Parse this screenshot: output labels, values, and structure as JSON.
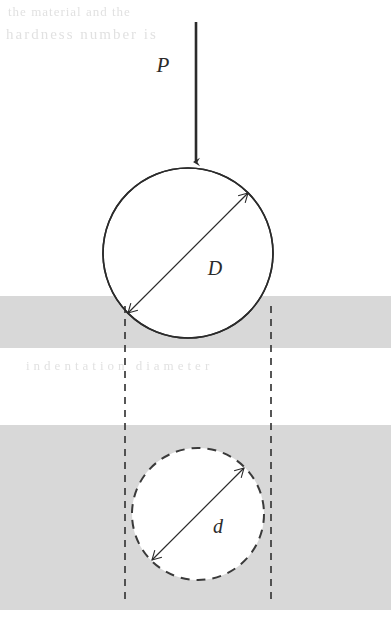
{
  "figure": {
    "background_color": "#ffffff",
    "specimen_color": "#d8d8d8",
    "line_color": "#2b2b2b",
    "width": 391,
    "height": 625
  },
  "labels": {
    "load": "P",
    "ball_diameter": "D",
    "indent_diameter": "d"
  },
  "annotations": {
    "load_arrow_name": "applied-load-arrow",
    "ball_arrow_name": "ball-diameter-arrow",
    "indent_arrow_name": "indent-diameter-arrow"
  },
  "geometry": {
    "upper_circle": {
      "cx": 188,
      "cy": 253,
      "r": 85,
      "style": "solid"
    },
    "lower_circle": {
      "cx": 198,
      "cy": 514,
      "r": 66,
      "style": "dashed"
    },
    "upper_band": {
      "x": 0,
      "y": 296,
      "width": 391,
      "height": 52
    },
    "lower_band": {
      "x": 0,
      "y": 425,
      "width": 391,
      "height": 185
    },
    "projection_lines": [
      125,
      271
    ],
    "load_line": {
      "x": 196,
      "y_top": 22,
      "y_tip": 168
    }
  },
  "ghost_text": {
    "row_top": "the material and the",
    "row_second": "hardness number is",
    "row_gap": "indentation  diameter"
  }
}
